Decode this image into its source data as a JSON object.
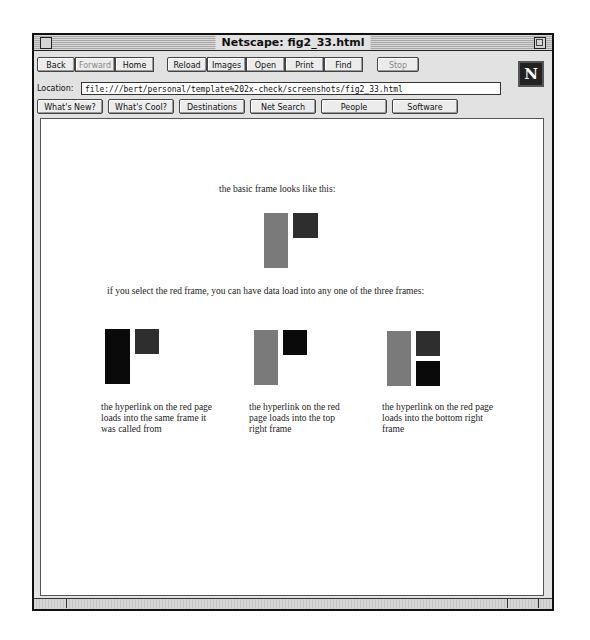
{
  "window": {
    "title": "Netscape: fig2_33.html"
  },
  "toolbar": {
    "buttons": [
      "Back",
      "Forward",
      "Home",
      "Reload",
      "Images",
      "Open",
      "Print",
      "Find",
      "Stop"
    ],
    "disabled": [
      "Forward",
      "Stop"
    ]
  },
  "location": {
    "label": "Location:",
    "url": "file:///bert/personal/template%202x-check/screenshots/fig2_33.html"
  },
  "directory_buttons": [
    "What's New?",
    "What's Cool?",
    "Destinations",
    "Net Search",
    "People",
    "Software"
  ],
  "logo": {
    "letter": "N"
  },
  "page": {
    "intro": "the basic frame looks like this:",
    "select_text": "if you select the red frame, you can have data load into any one of the three frames:",
    "examples": [
      {
        "caption_lines": [
          "the hyperlink on the red page",
          "loads into the same frame it",
          "was called from"
        ]
      },
      {
        "caption_lines": [
          "the hyperlink on the red",
          "page loads into the top",
          "right frame"
        ]
      },
      {
        "caption_lines": [
          "the hyperlink on the red page",
          "loads into the bottom right",
          "frame"
        ]
      }
    ]
  },
  "colors": {
    "frame_gray": "#7a7a7a",
    "frame_dark": "#2e2e2e",
    "frame_black": "#0a0a0a"
  }
}
